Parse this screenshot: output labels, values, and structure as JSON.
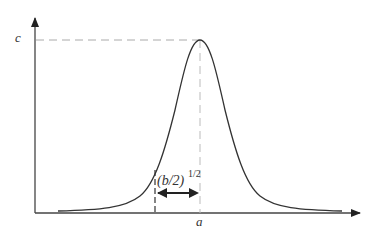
{
  "diagram": {
    "type": "gaussian-curve",
    "axes": {
      "x_label": "a",
      "y_label": "c"
    },
    "labels": {
      "peak_height": "c",
      "peak_position": "a",
      "width_base": "(b/2)",
      "width_exp": "1/2"
    },
    "colors": {
      "line": "#333333",
      "dashed": "#aaaaaa"
    }
  }
}
